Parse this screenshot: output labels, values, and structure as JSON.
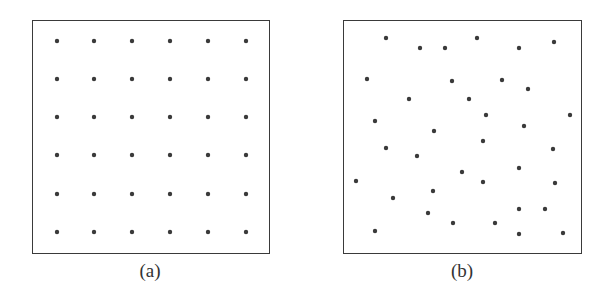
{
  "figure": {
    "panels": [
      {
        "label": "(a)",
        "arrangement": "regular-grid",
        "box": {
          "x": 32,
          "y": 20,
          "w": 238,
          "h": 234
        },
        "label_pos": {
          "x": 120,
          "y": 260
        },
        "dots": [
          [
            57,
            41
          ],
          [
            94,
            41
          ],
          [
            132,
            41
          ],
          [
            170,
            41
          ],
          [
            208,
            41
          ],
          [
            246,
            41
          ],
          [
            57,
            79
          ],
          [
            94,
            79
          ],
          [
            132,
            79
          ],
          [
            170,
            79
          ],
          [
            208,
            79
          ],
          [
            246,
            79
          ],
          [
            57,
            117
          ],
          [
            94,
            117
          ],
          [
            132,
            117
          ],
          [
            170,
            117
          ],
          [
            208,
            117
          ],
          [
            246,
            117
          ],
          [
            57,
            155
          ],
          [
            94,
            155
          ],
          [
            132,
            155
          ],
          [
            170,
            155
          ],
          [
            208,
            155
          ],
          [
            246,
            155
          ],
          [
            57,
            194
          ],
          [
            94,
            194
          ],
          [
            132,
            194
          ],
          [
            170,
            194
          ],
          [
            208,
            194
          ],
          [
            246,
            194
          ],
          [
            57,
            232
          ],
          [
            94,
            232
          ],
          [
            132,
            232
          ],
          [
            170,
            232
          ],
          [
            208,
            232
          ],
          [
            246,
            232
          ]
        ]
      },
      {
        "label": "(b)",
        "arrangement": "random",
        "box": {
          "x": 343,
          "y": 20,
          "w": 239,
          "h": 234
        },
        "label_pos": {
          "x": 432,
          "y": 260
        },
        "dots": [
          [
            386,
            38
          ],
          [
            420,
            48
          ],
          [
            445,
            48
          ],
          [
            477,
            38
          ],
          [
            519,
            48
          ],
          [
            554,
            42
          ],
          [
            367,
            79
          ],
          [
            452,
            81
          ],
          [
            502,
            80
          ],
          [
            528,
            89
          ],
          [
            409,
            99
          ],
          [
            469,
            99
          ],
          [
            375,
            121
          ],
          [
            486,
            115
          ],
          [
            570,
            115
          ],
          [
            524,
            126
          ],
          [
            434,
            131
          ],
          [
            483,
            141
          ],
          [
            386,
            148
          ],
          [
            417,
            156
          ],
          [
            553,
            149
          ],
          [
            462,
            172
          ],
          [
            519,
            168
          ],
          [
            356,
            181
          ],
          [
            483,
            182
          ],
          [
            555,
            183
          ],
          [
            433,
            191
          ],
          [
            393,
            198
          ],
          [
            428,
            213
          ],
          [
            519,
            209
          ],
          [
            545,
            209
          ],
          [
            453,
            223
          ],
          [
            495,
            223
          ],
          [
            375,
            231
          ],
          [
            519,
            234
          ],
          [
            563,
            233
          ]
        ]
      }
    ],
    "colors": {
      "dot": "#3a3a3a",
      "border": "#3a3a3a",
      "background": "#ffffff"
    }
  }
}
